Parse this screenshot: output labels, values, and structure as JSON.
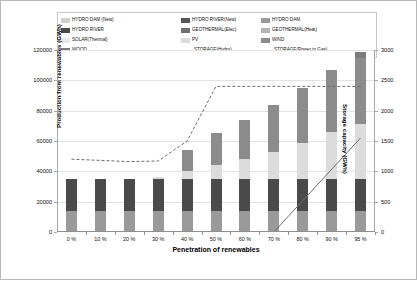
{
  "chart_data": {
    "type": "bar",
    "subtype": "stacked-column-with-lines",
    "title": "",
    "xlabel": "Penetration of renewables",
    "ylabel": "Production from renewables (GWh)",
    "ylabel_secondary": "Storage capacity (GWh)",
    "categories": [
      "0 %",
      "10 %",
      "20 %",
      "30 %",
      "40 %",
      "50 %",
      "60 %",
      "70 %",
      "80 %",
      "90 %",
      "95 %"
    ],
    "ylim": [
      0,
      120000
    ],
    "yticks": [
      "0",
      "20000",
      "40000",
      "60000",
      "80000",
      "100000",
      "120000"
    ],
    "ylim_secondary": [
      0,
      3000
    ],
    "yticks_secondary": [
      "0",
      "500",
      "1000",
      "1500",
      "2000",
      "2500",
      "3000"
    ],
    "grid": true,
    "legend_position": "top",
    "series": [
      {
        "name": "HYDRO DAM (New)",
        "color": "#d0d0d0",
        "values": [
          0,
          0,
          0,
          0,
          0,
          0,
          0,
          0,
          0,
          0,
          0
        ]
      },
      {
        "name": "HYDRO RIVER(New)",
        "color": "#565656",
        "values": [
          0,
          0,
          0,
          0,
          0,
          0,
          0,
          0,
          0,
          0,
          0
        ]
      },
      {
        "name": "HYDRO DAM",
        "color": "#9a9a9a",
        "values": [
          14000,
          14000,
          14000,
          14000,
          14000,
          14000,
          14000,
          14000,
          14000,
          14000,
          14000
        ]
      },
      {
        "name": "HYDRO RIVER",
        "color": "#4a4a4a",
        "values": [
          21000,
          21000,
          21000,
          21000,
          21000,
          21000,
          21000,
          21000,
          21000,
          21000,
          21000
        ]
      },
      {
        "name": "GEOTHERMAL(Elec)",
        "color": "#6f6f6f",
        "values": [
          0,
          0,
          0,
          0,
          0,
          0,
          0,
          0,
          0,
          0,
          0
        ]
      },
      {
        "name": "GEOTHERMAL(Heat)",
        "color": "#b4b4b4",
        "values": [
          0,
          0,
          0,
          0,
          0,
          0,
          0,
          0,
          0,
          0,
          0
        ]
      },
      {
        "name": "SOLAR(Thermal)",
        "color": "#e8e8e8",
        "values": [
          0,
          0,
          0,
          0,
          0,
          0,
          0,
          0,
          0,
          0,
          0
        ]
      },
      {
        "name": "PV",
        "color": "#dcdcdc",
        "values": [
          0,
          0,
          0,
          1500,
          5000,
          9000,
          13000,
          18000,
          24000,
          31000,
          36000
        ]
      },
      {
        "name": "WIND",
        "color": "#8c8c8c",
        "values": [
          0,
          0,
          0,
          0,
          14000,
          21000,
          26000,
          31000,
          36000,
          41000,
          44000
        ]
      },
      {
        "name": "WOOD",
        "color": "#7b7b7b",
        "values": [
          0,
          0,
          0,
          0,
          0,
          0,
          0,
          0,
          0,
          0,
          4000
        ]
      }
    ],
    "bar_totals": [
      35000,
      35000,
      35000,
      36500,
      54000,
      65000,
      74000,
      84000,
      95000,
      107000,
      119000
    ],
    "line_series": [
      {
        "name": "STORAGE(Hydro)",
        "style": "dashed",
        "color": "#6e6e6e",
        "axis": "secondary",
        "values": [
          1200,
          1180,
          1160,
          1170,
          1500,
          2400,
          2400,
          2400,
          2400,
          2400,
          2400
        ]
      },
      {
        "name": "STORAGE(Power to Gas)",
        "style": "solid",
        "color": "#6e6e6e",
        "axis": "secondary",
        "values": [
          0,
          0,
          0,
          0,
          0,
          0,
          0,
          0,
          0,
          0,
          1550
        ]
      }
    ],
    "legend_entries": [
      {
        "label": "HYDRO DAM (New)",
        "marker": "swatch",
        "color": "#d0d0d0"
      },
      {
        "label": "HYDRO RIVER(New)",
        "marker": "swatch",
        "color": "#565656"
      },
      {
        "label": "HYDRO DAM",
        "marker": "swatch",
        "color": "#9a9a9a"
      },
      {
        "label": "HYDRO RIVER",
        "marker": "swatch",
        "color": "#4a4a4a"
      },
      {
        "label": "GEOTHERMAL(Elec)",
        "marker": "swatch",
        "color": "#6f6f6f"
      },
      {
        "label": "GEOTHERMAL(Heat)",
        "marker": "swatch",
        "color": "#b4b4b4"
      },
      {
        "label": "SOLAR(Thermal)",
        "marker": "swatch",
        "color": "#e8e8e8"
      },
      {
        "label": "PV",
        "marker": "swatch",
        "color": "#dcdcdc"
      },
      {
        "label": "WIND",
        "marker": "swatch",
        "color": "#8c8c8c"
      },
      {
        "label": "WOOD",
        "marker": "swatch",
        "color": "#7b7b7b"
      },
      {
        "label": "STORAGE(Hydro)",
        "marker": "dashed-line",
        "color": "#6e6e6e"
      },
      {
        "label": "STORAGE(Power to Gas)",
        "marker": "solid-line",
        "color": "#6e6e6e"
      }
    ]
  }
}
